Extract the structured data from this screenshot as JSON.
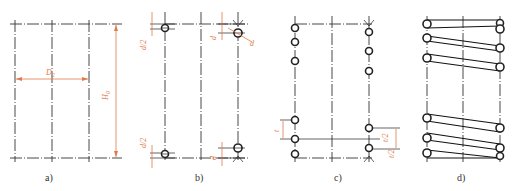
{
  "figure": {
    "panels": [
      {
        "id": "a",
        "caption": "a)",
        "labels": {
          "mean_diameter": "D2",
          "free_height": "H0"
        }
      },
      {
        "id": "b",
        "caption": "b)",
        "labels": {
          "half_wire_top": "d/2",
          "wire_top_right": "d",
          "wire_angle": "d",
          "half_wire_bottom": "d/2",
          "wire_bottom_right": "d"
        }
      },
      {
        "id": "c",
        "caption": "c)",
        "labels": {
          "pitch": "t",
          "half_pitch_upper": "t/2",
          "half_pitch_lower": "t/2"
        }
      },
      {
        "id": "d",
        "caption": "d)",
        "labels": {}
      }
    ],
    "colors": {
      "line": "#333333",
      "dimension": "#e07a4a",
      "coil": "#222222"
    }
  }
}
